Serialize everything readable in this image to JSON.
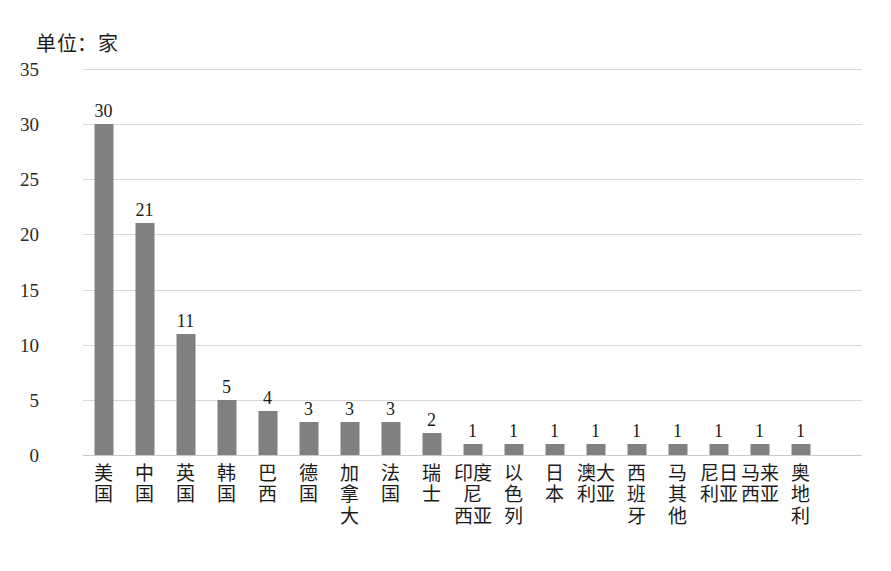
{
  "chart_data": {
    "type": "bar",
    "title": "",
    "unit_note": "单位：家",
    "xlabel": "",
    "ylabel": "",
    "ylim": [
      0,
      35
    ],
    "yticks": [
      0,
      5,
      10,
      15,
      20,
      25,
      30,
      35
    ],
    "grid": true,
    "legend": "none",
    "bar_color": "#808080",
    "gridline_color": "#d8d8d8",
    "categories": [
      "美国",
      "中国",
      "英国",
      "韩国",
      "巴西",
      "德国",
      "加拿大",
      "法国",
      "瑞士",
      "印度尼西亚",
      "以色列",
      "日本",
      "澳大利亚",
      "西班牙",
      "马其他",
      "尼日利亚",
      "马来西亚",
      "奥地利"
    ],
    "category_lines": [
      [
        "美",
        "国"
      ],
      [
        "中",
        "国"
      ],
      [
        "英",
        "国"
      ],
      [
        "韩",
        "国"
      ],
      [
        "巴",
        "西"
      ],
      [
        "德",
        "国"
      ],
      [
        "加",
        "拿",
        "大"
      ],
      [
        "法",
        "国"
      ],
      [
        "瑞",
        "士"
      ],
      [
        "印度尼",
        "西亚"
      ],
      [
        "以",
        "色",
        "列"
      ],
      [
        "日",
        "本"
      ],
      [
        "澳大",
        "利亚"
      ],
      [
        "西",
        "班",
        "牙"
      ],
      [
        "马",
        "其",
        "他"
      ],
      [
        "尼日",
        "利亚"
      ],
      [
        "马来",
        "西亚"
      ],
      [
        "奥",
        "地",
        "利"
      ]
    ],
    "values": [
      30,
      21,
      11,
      5,
      4,
      3,
      3,
      3,
      2,
      1,
      1,
      1,
      1,
      1,
      1,
      1,
      1,
      1
    ],
    "value_labels": [
      "30",
      "21",
      "11",
      "5",
      "4",
      "3",
      "3",
      "3",
      "2",
      "1",
      "1",
      "1",
      "1",
      "1",
      "1",
      "1",
      "1",
      "1"
    ],
    "ytick_labels": [
      "0",
      "5",
      "10",
      "15",
      "20",
      "25",
      "30",
      "35"
    ]
  }
}
